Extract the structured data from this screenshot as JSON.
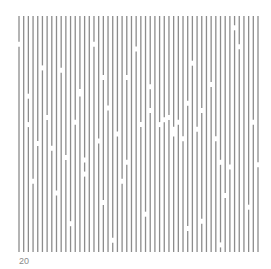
{
  "stimulus": {
    "type": "vertical-line-field-with-gaps",
    "line_count": 52,
    "line_color": "#8c8c8c",
    "gap_count": 56,
    "gaps_normalized": [
      [
        0.0,
        0.12
      ],
      [
        0.1,
        0.22
      ],
      [
        0.18,
        0.23
      ],
      [
        0.25,
        0.32
      ],
      [
        0.31,
        0.12
      ],
      [
        0.04,
        0.34
      ],
      [
        0.03,
        0.46
      ],
      [
        0.08,
        0.54
      ],
      [
        0.12,
        0.43
      ],
      [
        0.14,
        0.56
      ],
      [
        0.2,
        0.6
      ],
      [
        0.23,
        0.45
      ],
      [
        0.25,
        0.33
      ],
      [
        0.28,
        0.61
      ],
      [
        0.06,
        0.7
      ],
      [
        0.16,
        0.75
      ],
      [
        0.27,
        0.67
      ],
      [
        0.35,
        0.26
      ],
      [
        0.45,
        0.26
      ],
      [
        0.49,
        0.14
      ],
      [
        0.33,
        0.53
      ],
      [
        0.38,
        0.39
      ],
      [
        0.42,
        0.5
      ],
      [
        0.46,
        0.62
      ],
      [
        0.5,
        0.46
      ],
      [
        0.54,
        0.4
      ],
      [
        0.58,
        0.46
      ],
      [
        0.61,
        0.44
      ],
      [
        0.62,
        0.43
      ],
      [
        0.64,
        0.5
      ],
      [
        0.36,
        0.79
      ],
      [
        0.4,
        0.95
      ],
      [
        0.52,
        0.84
      ],
      [
        0.72,
        0.2
      ],
      [
        0.8,
        0.29
      ],
      [
        0.9,
        0.05
      ],
      [
        0.92,
        0.13
      ],
      [
        0.64,
        0.48
      ],
      [
        0.66,
        0.45
      ],
      [
        0.68,
        0.52
      ],
      [
        0.7,
        0.37
      ],
      [
        0.74,
        0.48
      ],
      [
        0.77,
        0.4
      ],
      [
        0.82,
        0.52
      ],
      [
        0.84,
        0.62
      ],
      [
        0.88,
        0.64
      ],
      [
        0.98,
        0.45
      ],
      [
        1.0,
        0.63
      ],
      [
        0.76,
        0.87
      ],
      [
        0.84,
        0.97
      ],
      [
        0.86,
        0.76
      ],
      [
        0.96,
        0.81
      ],
      [
        0.55,
        0.3
      ],
      [
        0.22,
        0.88
      ],
      [
        0.7,
        0.9
      ],
      [
        0.44,
        0.7
      ]
    ]
  },
  "label": {
    "text": "20"
  }
}
